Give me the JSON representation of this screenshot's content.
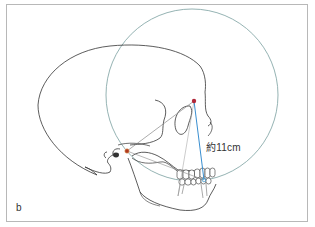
{
  "figure": {
    "panel_label": "b",
    "measurement_label": "約11cm",
    "elements": {
      "skull": "lateral-view skull outline (cranium, orbit, nasal bone, maxilla, mandible, teeth)",
      "circle": "large circle centered near the orbit region",
      "points": [
        {
          "name": "orbital-point",
          "x": 194,
          "y": 101,
          "color": "#b0283a"
        },
        {
          "name": "condyle-point",
          "x": 127,
          "y": 151,
          "color": "#b03a20"
        },
        {
          "name": "incisal-point",
          "x": 204,
          "y": 180,
          "color": "#4a9fd0"
        }
      ],
      "lines": [
        {
          "name": "measure-line",
          "from": "orbital-point",
          "to": "incisal-point",
          "color": "#3a8fd0"
        },
        {
          "name": "condyle-orbit-line",
          "from": "condyle-point",
          "to": "orbital-point",
          "color": "#888888"
        }
      ]
    },
    "colors": {
      "circle": "#6f9a9a",
      "outline": "#333333",
      "measure": "#3a8fd0",
      "frame": "#b8b8b8"
    }
  }
}
